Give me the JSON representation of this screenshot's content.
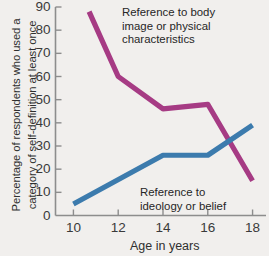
{
  "chart_data": {
    "type": "line",
    "title": "",
    "xlabel": "Age in years",
    "ylabel": "Percentage of respondents who used a category of self-definition at least once",
    "ylabel_line1": "Percentage of respondents who used a",
    "ylabel_line2": "category of self-definition at least once",
    "xlim": [
      9.2,
      18.6
    ],
    "ylim": [
      0,
      90
    ],
    "x_ticks": [
      10,
      12,
      14,
      16,
      18
    ],
    "x_tick_labels": [
      "10",
      "12",
      "14",
      "16",
      "18"
    ],
    "y_ticks": [
      0,
      10,
      20,
      30,
      40,
      50,
      60,
      70,
      80,
      90
    ],
    "y_tick_labels": [
      "0",
      "10",
      "20",
      "30",
      "40",
      "50",
      "60",
      "70",
      "80",
      "90"
    ],
    "grid": false,
    "legend_position": "inline-annotations",
    "series": [
      {
        "name": "Reference to body image or physical characteristics",
        "color": "#a63b84",
        "annotation": "Reference to body\nimage or physical\ncharacteristics",
        "x": [
          10.7,
          12.0,
          14.0,
          16.0,
          18.0
        ],
        "values": [
          88,
          60,
          46,
          48,
          15
        ]
      },
      {
        "name": "Reference to ideology or belief",
        "color": "#3c7bad",
        "annotation": "Reference to\nideology or belief",
        "x": [
          10.0,
          14.0,
          16.0,
          18.0
        ],
        "values": [
          5,
          26,
          26,
          39
        ]
      }
    ]
  }
}
